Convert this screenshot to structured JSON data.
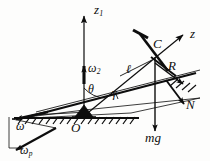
{
  "figure": {
    "kind": "physics-line-diagram",
    "ink_color": "#0d0d0d",
    "background_color": "#fdfdfc"
  },
  "labels": {
    "z1": {
      "base": "z",
      "sub": "1"
    },
    "z": {
      "base": "z",
      "sub": ""
    },
    "omega2": {
      "base": "ω",
      "sub": "2"
    },
    "omega": {
      "base": "ω",
      "sub": ""
    },
    "omega_p": {
      "base": "ω",
      "sub": "p"
    },
    "theta": {
      "base": "θ",
      "sub": ""
    },
    "gamma": {
      "base": "γ",
      "sub": ""
    },
    "ell": {
      "base": "ℓ",
      "sub": ""
    },
    "C": {
      "base": "C",
      "sub": ""
    },
    "R": {
      "base": "R",
      "sub": ""
    },
    "N": {
      "base": "N",
      "sub": ""
    },
    "mg": {
      "base": "mg",
      "sub": ""
    },
    "O": {
      "base": "O",
      "sub": ""
    }
  }
}
